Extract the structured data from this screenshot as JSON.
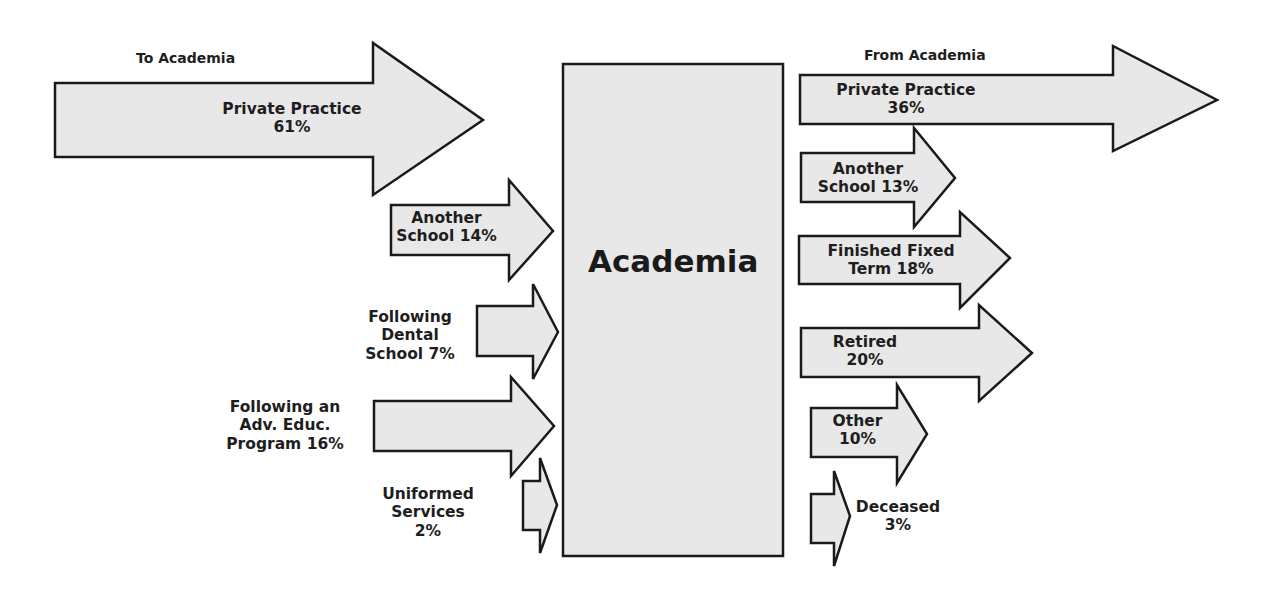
{
  "headers": {
    "to": "To Academia",
    "from": "From Academia"
  },
  "center": {
    "label": "Academia"
  },
  "colors": {
    "fill": "#e8e8e8",
    "stroke": "#1a1a1a",
    "background": "#ffffff"
  },
  "inflows": [
    {
      "line1": "Private Practice",
      "line2": "61%",
      "percent": 61
    },
    {
      "line1": "Another",
      "line2": "School 14%",
      "percent": 14
    },
    {
      "line1": "Following",
      "line2": "Dental",
      "line3": "School 7%",
      "percent": 7
    },
    {
      "line1": "Following an",
      "line2": "Adv. Educ.",
      "line3": "Program 16%",
      "percent": 16
    },
    {
      "line1": "Uniformed",
      "line2": "Services",
      "line3": "2%",
      "percent": 2
    }
  ],
  "outflows": [
    {
      "line1": "Private Practice",
      "line2": "36%",
      "percent": 36
    },
    {
      "line1": "Another",
      "line2": "School 13%",
      "percent": 13
    },
    {
      "line1": "Finished Fixed",
      "line2": "Term 18%",
      "percent": 18
    },
    {
      "line1": "Retired",
      "line2": "20%",
      "percent": 20
    },
    {
      "line1": "Other",
      "line2": "10%",
      "percent": 10
    },
    {
      "line1": "Deceased",
      "line2": "3%",
      "percent": 3
    }
  ]
}
